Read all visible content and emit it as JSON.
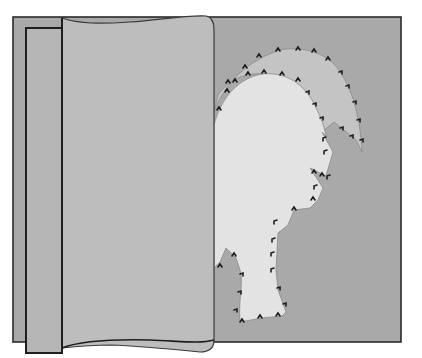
{
  "figure": {
    "title": "Appliqué rooster basted to background fabric with fabric fold lifted",
    "colors": {
      "background": "#ffffff",
      "base_fabric": "#a9a9a9",
      "tail_fabric": "#c4c4c4",
      "body_fabric": "#e3e3e3",
      "folded_fabric": "#bdbdbd",
      "under_panel": "#b6b6b6",
      "outline": "#2a2a2a",
      "stitch": "#1e1e1e"
    },
    "parts": [
      {
        "name": "base-board",
        "label": "Background fabric"
      },
      {
        "name": "rooster-tail",
        "label": "Tail appliqué"
      },
      {
        "name": "rooster-body",
        "label": "Body appliqué"
      },
      {
        "name": "folded-flap",
        "label": "Folded-over fabric layer"
      },
      {
        "name": "under-panel",
        "label": "Underlying panel"
      }
    ]
  }
}
